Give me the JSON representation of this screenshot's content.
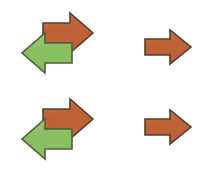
{
  "figure": {
    "background_color": "#ffffff",
    "width": 211,
    "height": 171,
    "layout": "2x2 grid of arrow groups"
  },
  "colors": {
    "orange_fill": "#c8663a",
    "orange_fill_light": "#d4794c",
    "orange_stroke": "#5a4030",
    "green_fill": "#8ec765",
    "green_fill_light": "#a6d680",
    "green_stroke": "#53603c",
    "background": "#ffffff",
    "texture_dark": "#a85430",
    "texture_light": "#e0a080"
  },
  "groups": [
    {
      "id": "group-top-left",
      "name": "top-left-arrow-pair",
      "description": "Orange right arrow with green left arrow overlapping",
      "arrow_count": 2,
      "arrows": [
        {
          "name": "orange-right-arrow",
          "color": "#c8663a",
          "direction": "right",
          "z": 1
        },
        {
          "name": "green-left-arrow",
          "color": "#8ec765",
          "direction": "left",
          "z": 2
        }
      ]
    },
    {
      "id": "group-top-right",
      "name": "top-right-single-arrow",
      "description": "Single orange right arrow",
      "arrow_count": 1,
      "arrows": [
        {
          "name": "orange-right-arrow",
          "color": "#c8663a",
          "direction": "right",
          "z": 1
        }
      ]
    },
    {
      "id": "group-bot-left",
      "name": "bottom-left-arrow-pair",
      "description": "Orange right arrow with green left arrow overlapping",
      "arrow_count": 2,
      "arrows": [
        {
          "name": "orange-right-arrow",
          "color": "#c8663a",
          "direction": "right",
          "z": 1
        },
        {
          "name": "green-left-arrow",
          "color": "#8ec765",
          "direction": "left",
          "z": 2
        }
      ]
    },
    {
      "id": "group-bot-right",
      "name": "bottom-right-single-arrow",
      "description": "Single orange right arrow",
      "arrow_count": 1,
      "arrows": [
        {
          "name": "orange-right-arrow",
          "color": "#c8663a",
          "direction": "right",
          "z": 1
        }
      ]
    }
  ]
}
